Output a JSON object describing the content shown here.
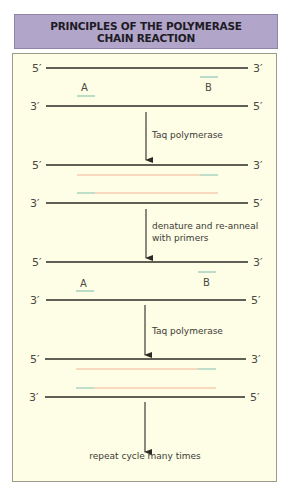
{
  "title": {
    "line1": "PRINCIPLES OF THE POLYMERASE",
    "line2": "CHAIN REACTION"
  },
  "colors": {
    "title_bg": "#b1a6c9",
    "panel_bg": "#fefde6",
    "strand": "#2b2a24",
    "primer": "#8cc7b4",
    "new_strand": "#f0b896"
  },
  "steps": [
    {
      "top_left": "5′",
      "top_right": "3′",
      "bottom_left": "3′",
      "bottom_right": "5′",
      "primer_a": "A",
      "primer_b": "B"
    },
    {
      "top_left": "5′",
      "top_right": "3′",
      "bottom_left": "3′",
      "bottom_right": "5′"
    },
    {
      "top_left": "5′",
      "top_right": "3′",
      "bottom_left": "3′",
      "bottom_right": "5′",
      "primer_a": "A",
      "primer_b": "B"
    },
    {
      "top_left": "5′",
      "top_right": "3′",
      "bottom_left": "3′",
      "bottom_right": "5′"
    }
  ],
  "arrows": [
    {
      "label_line1": "Taq polymerase"
    },
    {
      "label_line1": "denature and re-anneal",
      "label_line2": "with primers"
    },
    {
      "label_line1": "Taq polymerase"
    },
    {
      "label_line1": "repeat cycle many times"
    }
  ]
}
